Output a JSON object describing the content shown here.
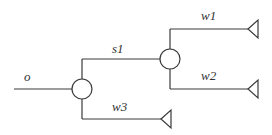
{
  "diagram": {
    "type": "tree",
    "labels": {
      "input": "o",
      "branch": "s1",
      "out1": "w1",
      "out2": "w2",
      "out3": "w3"
    },
    "nodes": [
      {
        "id": "split1",
        "shape": "circle"
      },
      {
        "id": "split2",
        "shape": "circle"
      }
    ],
    "terminals": [
      "w1",
      "w2",
      "w3"
    ],
    "edges": [
      {
        "from": "o",
        "to": "split1"
      },
      {
        "from": "split1",
        "to": "split2",
        "label": "s1"
      },
      {
        "from": "split1",
        "to": "w3",
        "label": "w3"
      },
      {
        "from": "split2",
        "to": "w1",
        "label": "w1"
      },
      {
        "from": "split2",
        "to": "w2",
        "label": "w2"
      }
    ],
    "colors": {
      "line": "#3a3a3a",
      "background": "#ffffff"
    }
  }
}
